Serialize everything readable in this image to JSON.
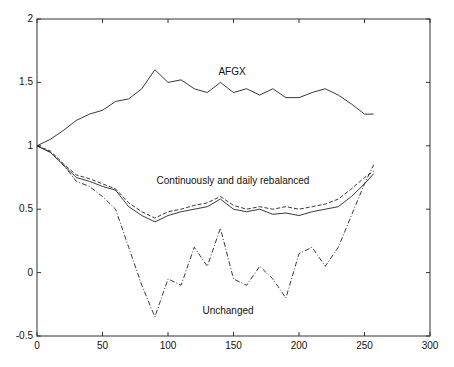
{
  "chart_data": {
    "type": "line",
    "title": "",
    "xlabel": "",
    "ylabel": "",
    "xlim": [
      0,
      300
    ],
    "ylim": [
      -0.5,
      2
    ],
    "xticks": [
      0,
      50,
      100,
      150,
      200,
      250,
      300
    ],
    "yticks": [
      -0.5,
      0,
      0.5,
      1,
      1.5,
      2
    ],
    "grid": false,
    "legend": "none (inline annotations)",
    "annotations": [
      {
        "text": "AFGX",
        "x": 150,
        "y": 1.72
      },
      {
        "text": "Continuously and daily rebalanced",
        "x": 150,
        "y": 0.72
      },
      {
        "text": "Unchanged",
        "x": 150,
        "y": -0.33
      }
    ],
    "x": [
      0,
      10,
      20,
      30,
      40,
      50,
      60,
      70,
      80,
      90,
      100,
      110,
      120,
      130,
      140,
      150,
      160,
      170,
      180,
      190,
      200,
      210,
      220,
      230,
      240,
      250,
      257
    ],
    "series": [
      {
        "name": "AFGX",
        "style": "solid",
        "values": [
          1.0,
          1.05,
          1.12,
          1.2,
          1.25,
          1.28,
          1.35,
          1.37,
          1.45,
          1.6,
          1.5,
          1.52,
          1.45,
          1.42,
          1.5,
          1.42,
          1.45,
          1.4,
          1.45,
          1.38,
          1.38,
          1.42,
          1.45,
          1.4,
          1.33,
          1.25,
          1.25
        ]
      },
      {
        "name": "Continuously rebalanced",
        "style": "solid",
        "values": [
          1.0,
          0.95,
          0.85,
          0.75,
          0.72,
          0.68,
          0.65,
          0.52,
          0.45,
          0.4,
          0.45,
          0.48,
          0.5,
          0.52,
          0.58,
          0.5,
          0.48,
          0.5,
          0.46,
          0.47,
          0.45,
          0.48,
          0.5,
          0.52,
          0.6,
          0.7,
          0.78
        ]
      },
      {
        "name": "Daily rebalanced",
        "style": "dashed",
        "values": [
          1.0,
          0.96,
          0.86,
          0.77,
          0.74,
          0.7,
          0.66,
          0.55,
          0.48,
          0.43,
          0.48,
          0.5,
          0.53,
          0.55,
          0.6,
          0.53,
          0.5,
          0.52,
          0.5,
          0.52,
          0.5,
          0.52,
          0.54,
          0.58,
          0.66,
          0.75,
          0.8
        ]
      },
      {
        "name": "Unchanged",
        "style": "dashdot",
        "values": [
          1.0,
          0.95,
          0.85,
          0.72,
          0.68,
          0.6,
          0.5,
          0.2,
          -0.1,
          -0.35,
          -0.05,
          -0.1,
          0.2,
          0.05,
          0.35,
          -0.05,
          -0.1,
          0.05,
          -0.05,
          -0.2,
          0.15,
          0.2,
          0.05,
          0.2,
          0.45,
          0.7,
          0.85
        ]
      }
    ]
  },
  "labels": {
    "afgx": "AFGX",
    "rebalanced": "Continuously and daily rebalanced",
    "unchanged": "Unchanged"
  }
}
